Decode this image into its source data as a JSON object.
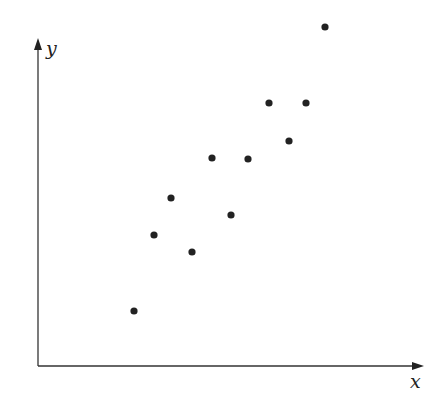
{
  "chart_data": {
    "type": "scatter",
    "title": "",
    "xlabel": "x",
    "ylabel": "y",
    "grid": false,
    "legend": null,
    "point_color": "#222222",
    "axis_color": "#333333",
    "points_px": [
      [
        134,
        311
      ],
      [
        154,
        235
      ],
      [
        171,
        198
      ],
      [
        192,
        252
      ],
      [
        212,
        158
      ],
      [
        231,
        215
      ],
      [
        248,
        159
      ],
      [
        269,
        103
      ],
      [
        289,
        141
      ],
      [
        306,
        103
      ],
      [
        325,
        27
      ]
    ],
    "points": [
      {
        "x": 96,
        "y": 55
      },
      {
        "x": 116,
        "y": 131
      },
      {
        "x": 133,
        "y": 168
      },
      {
        "x": 154,
        "y": 114
      },
      {
        "x": 174,
        "y": 208
      },
      {
        "x": 193,
        "y": 151
      },
      {
        "x": 210,
        "y": 207
      },
      {
        "x": 231,
        "y": 263
      },
      {
        "x": 251,
        "y": 225
      },
      {
        "x": 268,
        "y": 263
      },
      {
        "x": 287,
        "y": 339
      }
    ]
  }
}
